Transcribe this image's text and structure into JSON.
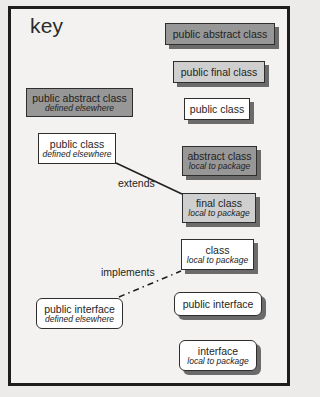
{
  "title": "key",
  "colors": {
    "abstract_fill": "#979797",
    "final_fill": "#cfcfcf",
    "class_fill": "#ffffff",
    "shadow": "#6b6b6b",
    "border": "#2e2e2e",
    "frame_border": "#1d1d1d"
  },
  "legend": {
    "public_abstract_class": {
      "main": "public abstract class"
    },
    "public_final_class": {
      "main": "public final class"
    },
    "public_class": {
      "main": "public class"
    },
    "ext_abstract_class": {
      "main": "public abstract class",
      "sub": "defined elsewhere"
    },
    "ext_public_class": {
      "main": "public class",
      "sub": "defined elsewhere"
    },
    "abstract_class_local": {
      "main": "abstract class",
      "sub": "local to package"
    },
    "final_class_local": {
      "main": "final class",
      "sub": "local to package"
    },
    "class_local": {
      "main": "class",
      "sub": "local to package"
    },
    "ext_public_interface": {
      "main": "public interface",
      "sub": "defined elsewhere"
    },
    "public_interface": {
      "main": "public interface"
    },
    "interface_local": {
      "main": "interface",
      "sub": "local to package"
    }
  },
  "relations": {
    "extends": {
      "label": "extends",
      "style": "solid"
    },
    "implements": {
      "label": "implements",
      "style": "dash-dot"
    }
  }
}
